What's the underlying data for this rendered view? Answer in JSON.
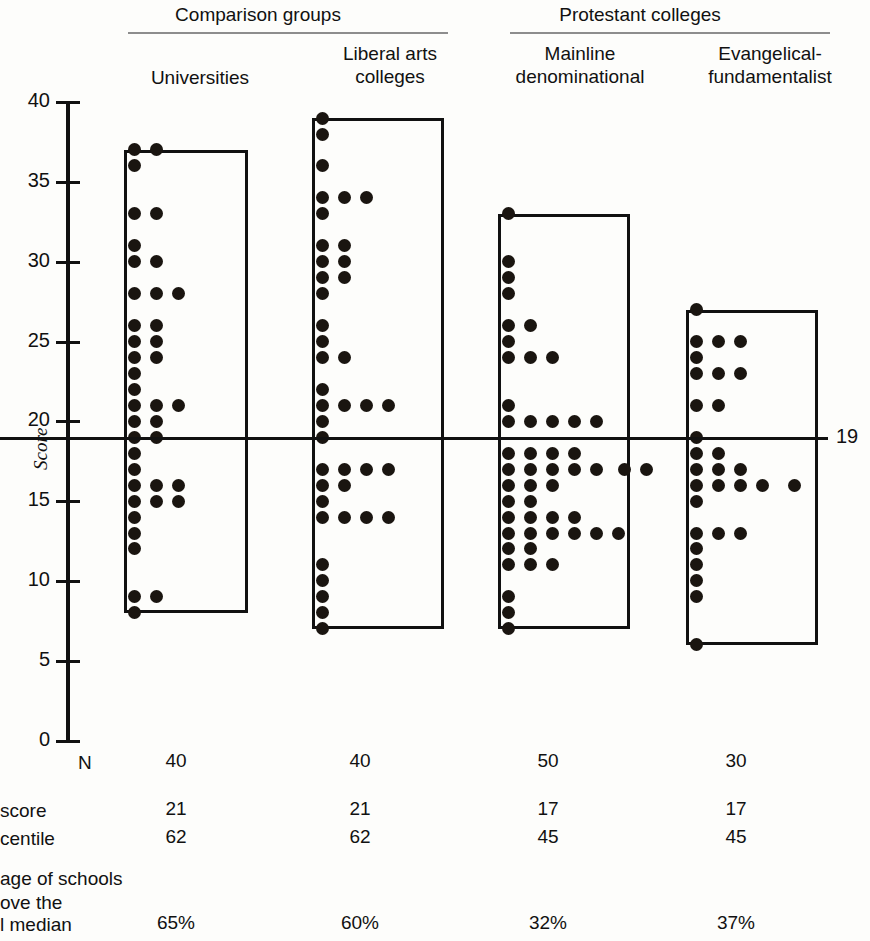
{
  "header": {
    "groups": [
      {
        "label": "Comparison groups"
      },
      {
        "label": "Protestant colleges"
      }
    ],
    "columns": [
      {
        "label": "Universities"
      },
      {
        "label": "Liberal arts\ncolleges"
      },
      {
        "label": "Mainline\ndenominational"
      },
      {
        "label": "Evangelical-\nfundamentalist"
      }
    ]
  },
  "axis": {
    "title": "Score",
    "ticks": [
      "40",
      "35",
      "30",
      "25",
      "20",
      "15",
      "10",
      "5",
      "0"
    ]
  },
  "median": {
    "value": 19,
    "label": "19"
  },
  "table": {
    "rows": [
      {
        "label": "N",
        "values": [
          "40",
          "40",
          "50",
          "30"
        ]
      },
      {
        "label": "score",
        "values": [
          "21",
          "21",
          "17",
          "17"
        ]
      },
      {
        "label": "centile",
        "values": [
          "62",
          "62",
          "45",
          "45"
        ]
      },
      {
        "label": "age of schools",
        "values": [
          "",
          "",
          "",
          ""
        ]
      },
      {
        "label": "ove the",
        "values": [
          "",
          "",
          "",
          ""
        ]
      },
      {
        "label": "l median",
        "values": [
          "65%",
          "60%",
          "32%",
          "37%"
        ]
      }
    ]
  },
  "chart_data": {
    "type": "scatter",
    "title": "",
    "xlabel": "",
    "ylabel": "Score",
    "ylim": [
      0,
      40
    ],
    "yticks": [
      0,
      5,
      10,
      15,
      20,
      25,
      30,
      35,
      40
    ],
    "grid": false,
    "legend": "none",
    "annotations": [
      {
        "text": "19",
        "y": 19,
        "note": "national median reference line"
      }
    ],
    "categories": [
      "Universities",
      "Liberal arts colleges",
      "Mainline denominational",
      "Evangelical-fundamentalist"
    ],
    "series": [
      {
        "name": "Universities",
        "n": 40,
        "box_top": 37,
        "box_bottom": 8,
        "median_score": 21,
        "percentile": 62,
        "pct_above_national_median": "65%",
        "dots": [
          {
            "score": 37,
            "count": 2
          },
          {
            "score": 36,
            "count": 1
          },
          {
            "score": 33,
            "count": 2
          },
          {
            "score": 31,
            "count": 1
          },
          {
            "score": 30,
            "count": 2
          },
          {
            "score": 28,
            "count": 3
          },
          {
            "score": 26,
            "count": 2
          },
          {
            "score": 25,
            "count": 2
          },
          {
            "score": 24,
            "count": 2
          },
          {
            "score": 23,
            "count": 1
          },
          {
            "score": 22,
            "count": 1
          },
          {
            "score": 21,
            "count": 3
          },
          {
            "score": 20,
            "count": 2
          },
          {
            "score": 19,
            "count": 2
          },
          {
            "score": 18,
            "count": 1
          },
          {
            "score": 17,
            "count": 1
          },
          {
            "score": 16,
            "count": 3
          },
          {
            "score": 15,
            "count": 3
          },
          {
            "score": 14,
            "count": 1
          },
          {
            "score": 13,
            "count": 1
          },
          {
            "score": 12,
            "count": 1
          },
          {
            "score": 9,
            "count": 2
          },
          {
            "score": 8,
            "count": 1
          }
        ]
      },
      {
        "name": "Liberal arts colleges",
        "n": 40,
        "box_top": 39,
        "box_bottom": 7,
        "median_score": 21,
        "percentile": 62,
        "pct_above_national_median": "60%",
        "dots": [
          {
            "score": 39,
            "count": 1
          },
          {
            "score": 38,
            "count": 1
          },
          {
            "score": 36,
            "count": 1
          },
          {
            "score": 34,
            "count": 3
          },
          {
            "score": 33,
            "count": 1
          },
          {
            "score": 31,
            "count": 2
          },
          {
            "score": 30,
            "count": 2
          },
          {
            "score": 29,
            "count": 2
          },
          {
            "score": 28,
            "count": 1
          },
          {
            "score": 26,
            "count": 1
          },
          {
            "score": 25,
            "count": 1
          },
          {
            "score": 24,
            "count": 2
          },
          {
            "score": 22,
            "count": 1
          },
          {
            "score": 21,
            "count": 4
          },
          {
            "score": 20,
            "count": 1
          },
          {
            "score": 19,
            "count": 1
          },
          {
            "score": 17,
            "count": 4
          },
          {
            "score": 16,
            "count": 2
          },
          {
            "score": 15,
            "count": 1
          },
          {
            "score": 14,
            "count": 4
          },
          {
            "score": 11,
            "count": 1
          },
          {
            "score": 10,
            "count": 1
          },
          {
            "score": 9,
            "count": 1
          },
          {
            "score": 8,
            "count": 1
          },
          {
            "score": 7,
            "count": 1
          }
        ]
      },
      {
        "name": "Mainline denominational",
        "n": 50,
        "box_top": 33,
        "box_bottom": 7,
        "median_score": 17,
        "percentile": 45,
        "pct_above_national_median": "32%",
        "dots": [
          {
            "score": 33,
            "count": 1
          },
          {
            "score": 30,
            "count": 1
          },
          {
            "score": 29,
            "count": 1
          },
          {
            "score": 28,
            "count": 1
          },
          {
            "score": 26,
            "count": 2
          },
          {
            "score": 25,
            "count": 1
          },
          {
            "score": 24,
            "count": 3
          },
          {
            "score": 21,
            "count": 1
          },
          {
            "score": 20,
            "count": 5
          },
          {
            "score": 18,
            "count": 4
          },
          {
            "score": 17,
            "count": 7
          },
          {
            "score": 16,
            "count": 3
          },
          {
            "score": 15,
            "count": 2
          },
          {
            "score": 14,
            "count": 4
          },
          {
            "score": 13,
            "count": 6
          },
          {
            "score": 12,
            "count": 2
          },
          {
            "score": 11,
            "count": 3
          },
          {
            "score": 9,
            "count": 1
          },
          {
            "score": 8,
            "count": 1
          },
          {
            "score": 7,
            "count": 1
          }
        ]
      },
      {
        "name": "Evangelical-fundamentalist",
        "n": 30,
        "box_top": 27,
        "box_bottom": 6,
        "median_score": 17,
        "percentile": 45,
        "pct_above_national_median": "37%",
        "dots": [
          {
            "score": 27,
            "count": 1
          },
          {
            "score": 25,
            "count": 3
          },
          {
            "score": 24,
            "count": 1
          },
          {
            "score": 23,
            "count": 3
          },
          {
            "score": 21,
            "count": 2
          },
          {
            "score": 19,
            "count": 1
          },
          {
            "score": 18,
            "count": 2
          },
          {
            "score": 17,
            "count": 3
          },
          {
            "score": 16,
            "count": 5
          },
          {
            "score": 15,
            "count": 1
          },
          {
            "score": 13,
            "count": 3
          },
          {
            "score": 12,
            "count": 1
          },
          {
            "score": 11,
            "count": 1
          },
          {
            "score": 10,
            "count": 1
          },
          {
            "score": 9,
            "count": 1
          },
          {
            "score": 6,
            "count": 1
          }
        ]
      }
    ]
  }
}
